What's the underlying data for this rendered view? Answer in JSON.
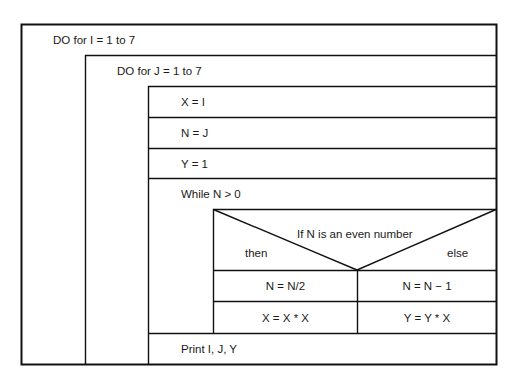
{
  "diagram": {
    "type": "Nassi-Shneiderman structured chart",
    "outer_loop": {
      "label": "DO for I = 1 to 7"
    },
    "inner_loop": {
      "label": "DO for J = 1 to 7"
    },
    "statements": [
      {
        "label": "X = I"
      },
      {
        "label": "N = J"
      },
      {
        "label": "Y = 1"
      }
    ],
    "while_loop": {
      "label": "While N > 0",
      "decision": {
        "condition": "If N is an even number",
        "then_label": "then",
        "else_label": "else",
        "then_branch": [
          "N = N/2",
          "X = X * X"
        ],
        "else_branch": [
          "N = N − 1",
          "Y = Y * X"
        ]
      }
    },
    "final_statement": {
      "label": "Print I, J, Y"
    }
  }
}
